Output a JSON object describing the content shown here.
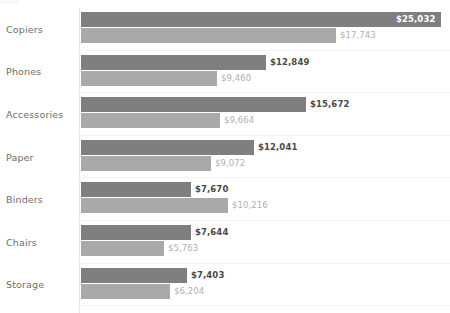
{
  "header": {
    "clipped_title": "Sales"
  },
  "chart_data": {
    "type": "bar",
    "orientation": "horizontal",
    "title": "",
    "subtitle": "",
    "xlabel": "",
    "ylabel": "",
    "grid": true,
    "legend": "none",
    "axis_line_color": "#e4e4e4",
    "xlim": [
      0,
      25032
    ],
    "categories": [
      "Copiers",
      "Phones",
      "Accessories",
      "Paper",
      "Binders",
      "Chairs",
      "Storage"
    ],
    "series": [
      {
        "name": "Primary",
        "color": "#7f7f7f",
        "values": [
          25032,
          12849,
          15672,
          12041,
          7670,
          7644,
          7403
        ],
        "labels": [
          "$25,032",
          "$12,849",
          "$15,672",
          "$12,041",
          "$7,670",
          "$7,644",
          "$7,403"
        ]
      },
      {
        "name": "Secondary",
        "color": "#a9a9a9",
        "values": [
          17743,
          9460,
          9664,
          9072,
          10216,
          5763,
          6204
        ],
        "labels": [
          "$17,743",
          "$9,460",
          "$9,664",
          "$9,072",
          "$10,216",
          "$5,763",
          "$6,204"
        ]
      }
    ]
  },
  "rows": [
    {
      "category": "Copiers",
      "primary": {
        "label": "$25,032",
        "width_px": 360,
        "label_placement": "inside"
      },
      "secondary": {
        "label": "$17,743",
        "width_px": 255,
        "label_placement": "outside"
      }
    },
    {
      "category": "Phones",
      "primary": {
        "label": "$12,849",
        "width_px": 185,
        "label_placement": "outside"
      },
      "secondary": {
        "label": "$9,460",
        "width_px": 136,
        "label_placement": "outside"
      }
    },
    {
      "category": "Accessories",
      "primary": {
        "label": "$15,672",
        "width_px": 225,
        "label_placement": "outside"
      },
      "secondary": {
        "label": "$9,664",
        "width_px": 139,
        "label_placement": "outside"
      }
    },
    {
      "category": "Paper",
      "primary": {
        "label": "$12,041",
        "width_px": 173,
        "label_placement": "outside"
      },
      "secondary": {
        "label": "$9,072",
        "width_px": 130,
        "label_placement": "outside"
      }
    },
    {
      "category": "Binders",
      "primary": {
        "label": "$7,670",
        "width_px": 110,
        "label_placement": "outside"
      },
      "secondary": {
        "label": "$10,216",
        "width_px": 147,
        "label_placement": "outside"
      }
    },
    {
      "category": "Chairs",
      "primary": {
        "label": "$7,644",
        "width_px": 110,
        "label_placement": "outside"
      },
      "secondary": {
        "label": "$5,763",
        "width_px": 83,
        "label_placement": "outside"
      }
    },
    {
      "category": "Storage",
      "primary": {
        "label": "$7,403",
        "width_px": 106,
        "label_placement": "outside"
      },
      "secondary": {
        "label": "$6,204",
        "width_px": 89,
        "label_placement": "outside"
      }
    }
  ]
}
